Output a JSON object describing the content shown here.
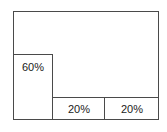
{
  "diagram": {
    "regions": [
      {
        "id": "top",
        "label": ""
      },
      {
        "id": "left",
        "label": "60%"
      },
      {
        "id": "bottom-middle",
        "label": "20%"
      },
      {
        "id": "bottom-right",
        "label": "20%"
      }
    ]
  }
}
